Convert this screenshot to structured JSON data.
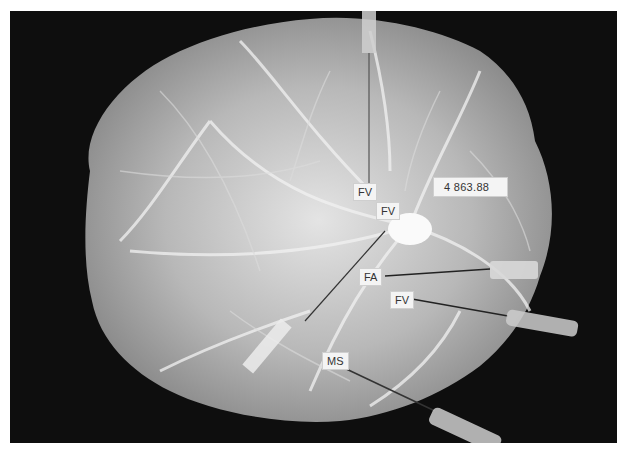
{
  "image": {
    "description": "Grayscale photograph of a placental vascular cast with cannulas inserted, on black background",
    "background_color": "#0e0e0e",
    "specimen_color": "#bdbdbd"
  },
  "labels": {
    "weight": "4 863.88",
    "fv_top": "FV",
    "fv_middle": "FV",
    "fa": "FA",
    "fv_lower": "FV",
    "ms": "MS"
  }
}
